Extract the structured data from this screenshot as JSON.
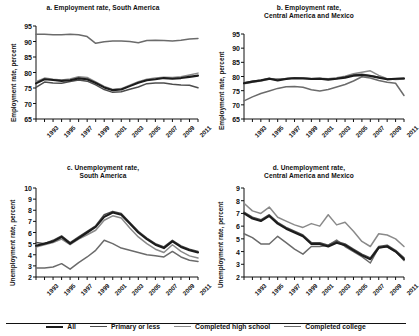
{
  "figure": {
    "legend_items": [
      {
        "label": "All",
        "color": "#1c1c1c",
        "width": 2.1
      },
      {
        "label": "Primary or less",
        "color": "#4d4d4d",
        "width": 1.5
      },
      {
        "label": "Completed high school",
        "color": "#8a8a8a",
        "width": 1.5
      },
      {
        "label": "Completed college",
        "color": "#6b6b6b",
        "width": 1.5
      }
    ]
  },
  "chart_data": [
    {
      "id": "panel-a",
      "type": "line",
      "title": "a. Employment rate, South America",
      "title_lines": [
        "a. Employment rate, South America"
      ],
      "xlabel": "",
      "ylabel": "Employment rate, percent",
      "ylim": [
        65,
        95
      ],
      "yticks": [
        65,
        70,
        75,
        80,
        85,
        90,
        95
      ],
      "xlim": [
        1993,
        2012
      ],
      "x": [
        1993,
        1994,
        1995,
        1996,
        1997,
        1998,
        1999,
        2000,
        2001,
        2002,
        2003,
        2004,
        2005,
        2006,
        2007,
        2008,
        2009,
        2010,
        2011,
        2012
      ],
      "xticks": [
        1993,
        1994,
        1995,
        1996,
        1997,
        1998,
        1999,
        2000,
        2001,
        2002,
        2003,
        2004,
        2005,
        2006,
        2007,
        2008,
        2009,
        2010,
        2011,
        2012
      ],
      "xticklabels": [
        "1993",
        "",
        "1995",
        "",
        "1997",
        "",
        "1999",
        "",
        "2001",
        "",
        "2003",
        "",
        "2005",
        "",
        "2007",
        "",
        "2009",
        "",
        "2011",
        ""
      ],
      "grid": false,
      "legend_position": "figure-bottom",
      "series": [
        {
          "name": "All",
          "values": [
            76.5,
            77.8,
            77.6,
            77.3,
            77.5,
            78.1,
            77.8,
            76.6,
            75.2,
            74.3,
            74.5,
            75.6,
            76.7,
            77.5,
            77.8,
            78.2,
            78.0,
            78.2,
            78.6,
            79.0
          ]
        },
        {
          "name": "Primary or less",
          "values": [
            75.2,
            76.9,
            76.6,
            76.5,
            77.1,
            77.6,
            77.2,
            76.0,
            74.5,
            73.6,
            73.8,
            74.6,
            75.3,
            76.4,
            76.6,
            76.6,
            76.2,
            76.0,
            75.9,
            75.1
          ]
        },
        {
          "name": "Completed high school",
          "values": [
            77.0,
            78.2,
            77.8,
            77.6,
            77.9,
            78.6,
            78.4,
            77.0,
            75.5,
            74.5,
            74.8,
            75.9,
            77.0,
            77.8,
            78.2,
            78.5,
            78.4,
            78.6,
            79.2,
            79.8
          ]
        },
        {
          "name": "Completed college",
          "values": [
            92.3,
            92.3,
            92.2,
            92.2,
            92.3,
            92.2,
            91.6,
            89.4,
            89.9,
            90.2,
            90.2,
            90.0,
            89.6,
            90.3,
            90.4,
            90.3,
            90.2,
            90.4,
            90.8,
            91.0
          ]
        }
      ]
    },
    {
      "id": "panel-b",
      "type": "line",
      "title": "b. Employment rate, Central America and Mexico",
      "title_lines": [
        "b. Employment rate,",
        "Central America and Mexico"
      ],
      "xlabel": "",
      "ylabel": "Employment rate, percent",
      "ylim": [
        65,
        95
      ],
      "yticks": [
        65,
        70,
        75,
        80,
        85,
        90,
        95
      ],
      "xlim": [
        1993,
        2012
      ],
      "x": [
        1993,
        1994,
        1995,
        1996,
        1997,
        1998,
        1999,
        2000,
        2001,
        2002,
        2003,
        2004,
        2005,
        2006,
        2007,
        2008,
        2009,
        2010,
        2011,
        2012
      ],
      "xticks": [
        1993,
        1994,
        1995,
        1996,
        1997,
        1998,
        1999,
        2000,
        2001,
        2002,
        2003,
        2004,
        2005,
        2006,
        2007,
        2008,
        2009,
        2010,
        2011,
        2012
      ],
      "xticklabels": [
        "1993",
        "",
        "1995",
        "",
        "1997",
        "",
        "1999",
        "",
        "2001",
        "",
        "2003",
        "",
        "2005",
        "",
        "2007",
        "",
        "2009",
        "",
        "2011",
        ""
      ],
      "grid": false,
      "legend_position": "figure-bottom",
      "series": [
        {
          "name": "All",
          "values": [
            77.6,
            78.2,
            78.6,
            79.2,
            78.6,
            79.1,
            79.4,
            79.3,
            79.1,
            79.2,
            78.9,
            79.2,
            79.6,
            80.3,
            80.5,
            80.2,
            79.6,
            79.0,
            79.2,
            79.3
          ]
        },
        {
          "name": "Primary or less",
          "values": [
            77.8,
            78.3,
            78.8,
            79.4,
            78.8,
            79.3,
            79.5,
            79.5,
            79.2,
            79.3,
            79.0,
            79.3,
            79.8,
            80.5,
            80.8,
            80.4,
            79.7,
            79.1,
            79.2,
            79.4
          ]
        },
        {
          "name": "Completed high school",
          "values": [
            77.4,
            78.0,
            78.4,
            79.0,
            79.2,
            79.3,
            79.6,
            79.5,
            79.3,
            79.4,
            79.2,
            79.6,
            80.1,
            81.0,
            81.5,
            82.0,
            80.4,
            79.2,
            78.9,
            79.1
          ]
        },
        {
          "name": "Completed college",
          "values": [
            71.4,
            72.8,
            74.0,
            74.9,
            75.8,
            76.4,
            76.5,
            76.2,
            75.3,
            74.9,
            75.4,
            76.3,
            77.2,
            78.4,
            79.9,
            79.5,
            78.6,
            78.0,
            77.6,
            73.3
          ]
        }
      ]
    },
    {
      "id": "panel-c",
      "type": "line",
      "title": "c. Unemployment rate, South America",
      "title_lines": [
        "c. Unemployment rate,",
        "South America"
      ],
      "xlabel": "",
      "ylabel": "Unemployment rate, percent",
      "ylim": [
        2,
        10
      ],
      "yticks": [
        2,
        3,
        4,
        5,
        6,
        7,
        8,
        9,
        10
      ],
      "xlim": [
        1993,
        2012
      ],
      "x": [
        1993,
        1994,
        1995,
        1996,
        1997,
        1998,
        1999,
        2000,
        2001,
        2002,
        2003,
        2004,
        2005,
        2006,
        2007,
        2008,
        2009,
        2010,
        2011,
        2012
      ],
      "xticks": [
        1993,
        1994,
        1995,
        1996,
        1997,
        1998,
        1999,
        2000,
        2001,
        2002,
        2003,
        2004,
        2005,
        2006,
        2007,
        2008,
        2009,
        2010,
        2011,
        2012
      ],
      "xticklabels": [
        "1993",
        "",
        "1995",
        "",
        "1997",
        "",
        "1999",
        "",
        "2001",
        "",
        "2003",
        "",
        "2005",
        "",
        "2007",
        "",
        "2009",
        "",
        "2011",
        ""
      ],
      "grid": false,
      "legend_position": "figure-bottom",
      "series": [
        {
          "name": "All",
          "values": [
            4.8,
            5.0,
            5.2,
            5.6,
            5.0,
            5.5,
            6.0,
            6.5,
            7.4,
            7.8,
            7.6,
            6.8,
            6.0,
            5.4,
            4.9,
            4.6,
            5.2,
            4.7,
            4.4,
            4.2
          ]
        },
        {
          "name": "Primary or less",
          "values": [
            5.1,
            5.0,
            5.3,
            5.7,
            5.1,
            5.6,
            6.1,
            6.6,
            7.6,
            7.9,
            7.7,
            6.9,
            6.1,
            5.5,
            5.0,
            4.7,
            5.3,
            4.8,
            4.5,
            4.3
          ]
        },
        {
          "name": "Completed high school",
          "values": [
            4.7,
            4.9,
            5.1,
            5.4,
            4.9,
            5.4,
            5.8,
            6.2,
            7.1,
            7.5,
            7.3,
            6.4,
            5.6,
            5.0,
            4.5,
            4.2,
            4.9,
            4.3,
            3.9,
            3.7
          ]
        },
        {
          "name": "Completed college",
          "values": [
            2.8,
            2.8,
            2.9,
            3.2,
            2.7,
            3.3,
            3.8,
            4.4,
            5.3,
            5.0,
            4.6,
            4.4,
            4.2,
            4.0,
            3.9,
            3.8,
            4.3,
            3.8,
            3.5,
            3.4
          ]
        }
      ]
    },
    {
      "id": "panel-d",
      "type": "line",
      "title": "d. Unemployment rate, Central America and Mexico",
      "title_lines": [
        "d. Unemployment rate,",
        "Central America and Mexico"
      ],
      "xlabel": "",
      "ylabel": "Unemployment rate, percent",
      "ylim": [
        2,
        9
      ],
      "yticks": [
        2,
        3,
        4,
        5,
        6,
        7,
        8,
        9
      ],
      "xlim": [
        1993,
        2012
      ],
      "x": [
        1993,
        1994,
        1995,
        1996,
        1997,
        1998,
        1999,
        2000,
        2001,
        2002,
        2003,
        2004,
        2005,
        2006,
        2007,
        2008,
        2009,
        2010,
        2011,
        2012
      ],
      "xticks": [
        1993,
        1994,
        1995,
        1996,
        1997,
        1998,
        1999,
        2000,
        2001,
        2002,
        2003,
        2004,
        2005,
        2006,
        2007,
        2008,
        2009,
        2010,
        2011,
        2012
      ],
      "xticklabels": [
        "1993",
        "",
        "1995",
        "",
        "1997",
        "",
        "1999",
        "",
        "2001",
        "",
        "2003",
        "",
        "2005",
        "",
        "2007",
        "",
        "2009",
        "",
        "2011",
        ""
      ],
      "grid": false,
      "legend_position": "figure-bottom",
      "series": [
        {
          "name": "All",
          "values": [
            7.0,
            6.6,
            6.4,
            6.8,
            6.2,
            5.8,
            5.5,
            5.2,
            4.6,
            4.6,
            4.4,
            4.7,
            4.5,
            4.1,
            3.7,
            3.4,
            4.3,
            4.4,
            4.0,
            3.4
          ]
        },
        {
          "name": "Primary or less",
          "values": [
            7.1,
            6.7,
            6.5,
            6.9,
            6.3,
            5.9,
            5.6,
            5.3,
            4.7,
            4.7,
            4.5,
            4.8,
            4.6,
            4.2,
            3.8,
            3.5,
            4.4,
            4.5,
            4.1,
            3.5
          ]
        },
        {
          "name": "Completed high school",
          "values": [
            7.8,
            7.2,
            7.0,
            7.5,
            6.7,
            6.4,
            6.1,
            5.9,
            6.2,
            6.0,
            6.9,
            6.1,
            6.3,
            5.6,
            4.8,
            4.4,
            5.4,
            5.3,
            5.0,
            4.4
          ]
        },
        {
          "name": "Completed college",
          "values": [
            5.4,
            5.1,
            4.6,
            4.6,
            5.2,
            4.7,
            4.2,
            3.8,
            4.4,
            4.4,
            4.5,
            4.9,
            4.4,
            4.0,
            3.6,
            3.1,
            4.3,
            4.4,
            4.0,
            3.3
          ]
        }
      ]
    }
  ]
}
